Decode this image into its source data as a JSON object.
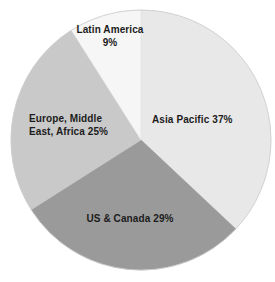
{
  "chart_data": {
    "type": "pie",
    "title": "",
    "subtitle": "",
    "xlabel": "",
    "ylabel": "",
    "legend_position": "none",
    "grid": false,
    "labels_inside_slices": true,
    "total_percent": 100,
    "categories": [
      "Asia Pacific",
      "US & Canada",
      "Europe, Middle East, Africa",
      "Latin America"
    ],
    "values": [
      37,
      29,
      25,
      9
    ],
    "units": "%",
    "start_angle_deg": 0,
    "direction": "clockwise",
    "center": {
      "x": 141,
      "y": 140
    },
    "radius": 130,
    "slices": [
      {
        "name": "Asia Pacific",
        "value": 37,
        "percent_label": "37%",
        "label_text": "Asia Pacific 37%",
        "color": "#e8e8e8",
        "start_angle_deg": 0,
        "end_angle_deg": 133.2
      },
      {
        "name": "US & Canada",
        "value": 29,
        "percent_label": "29%",
        "label_text": "US & Canada 29%",
        "color": "#9a9a9a",
        "start_angle_deg": 133.2,
        "end_angle_deg": 237.6
      },
      {
        "name": "Europe, Middle East, Africa",
        "value": 25,
        "percent_label": "25%",
        "label_line_1": "Europe, Middle",
        "label_line_2": "East, Africa 25%",
        "color": "#c9c9c9",
        "start_angle_deg": 237.6,
        "end_angle_deg": 327.6
      },
      {
        "name": "Latin America",
        "value": 9,
        "percent_label": "9%",
        "label_line_1": "Latin America",
        "label_line_2": "9%",
        "color": "#f6f6f6",
        "start_angle_deg": 327.6,
        "end_angle_deg": 360
      }
    ],
    "background_color": "#ffffff",
    "text_color": "#1c1c1c",
    "outline_color": "#cfcfcf"
  },
  "labels": {
    "latin_america_line1": "Latin America",
    "latin_america_line2": "9%",
    "asia_pacific": "Asia Pacific 37%",
    "europe_mea_line1": "Europe, Middle",
    "europe_mea_line2": "East, Africa 25%",
    "us_canada": "US & Canada 29%"
  }
}
